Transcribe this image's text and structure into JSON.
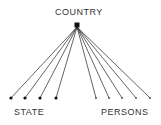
{
  "diagram": {
    "root": {
      "label": "COUNTRY",
      "x": 77,
      "y": 25
    },
    "groups": [
      {
        "label": "STATE",
        "node_style": "filled-dot",
        "children_x": [
          11,
          25,
          40,
          56
        ]
      },
      {
        "label": "PERSONS",
        "node_style": "small-dot",
        "children_x": [
          96,
          109,
          122,
          136,
          150
        ]
      }
    ],
    "child_y": 98,
    "colors": {
      "line": "#222222",
      "text": "#333333"
    }
  }
}
